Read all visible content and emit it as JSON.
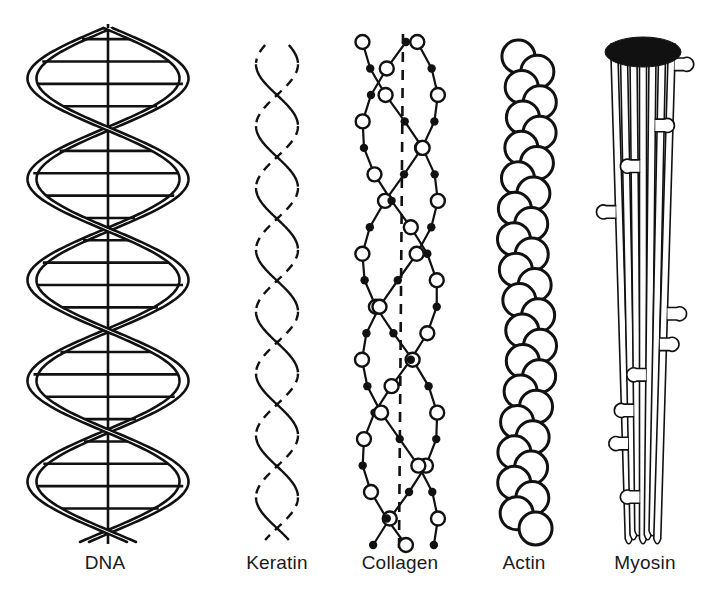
{
  "figure": {
    "background_color": "#ffffff",
    "ink_color": "#111111",
    "width": 705,
    "height": 596,
    "caption_baseline_y": 566,
    "caption_font_size": 19
  },
  "panels": [
    {
      "id": "dna",
      "label": "DNA",
      "label_center_x": 105,
      "structure_type": "double-helix-ribbon",
      "axis_x": 108,
      "top_y": 28,
      "bottom_y": 542,
      "amplitude": 76,
      "turns": 2.55,
      "ribbon_width": 9,
      "stroke_width": 2.6,
      "rung_count": 22,
      "rung_stroke_width": 2.6,
      "has_center_axis": true,
      "strand_count": 2,
      "description": "Right-handed double helix: two ribbon strands with horizontal base-pair rungs crossing a straight vertical axis"
    },
    {
      "id": "keratin",
      "label": "Keratin",
      "label_center_x": 277,
      "structure_type": "coiled-coil",
      "axis_x": 277,
      "top_y": 45,
      "bottom_y": 540,
      "amplitude": 21,
      "turns": 4.0,
      "stroke_width": 2.4,
      "dash_pattern": "9 7",
      "strand_count": 2,
      "has_center_axis": false,
      "description": "Two alpha-helical strands wound around each other; rear-facing segments drawn dashed"
    },
    {
      "id": "collagen",
      "label": "Collagen",
      "label_center_x": 400,
      "structure_type": "triple-helix-beaded",
      "axis_x": 400,
      "top_y": 42,
      "bottom_y": 545,
      "amplitude": 38,
      "turns": 1.55,
      "stroke_width": 2.2,
      "strand_count": 3,
      "bead_open_radius": 7.0,
      "bead_filled_radius": 4.2,
      "beads_per_strand": 19,
      "has_center_axis": true,
      "center_axis_dashed": true,
      "center_axis_dash_pattern": "10 8",
      "description": "Three polypeptide chains of alternating large open and small filled residues twisted about a dashed central axis"
    },
    {
      "id": "actin",
      "label": "Actin",
      "label_center_x": 524,
      "structure_type": "globular-double-strand",
      "axis_x": 527,
      "top_y": 40,
      "bottom_y": 545,
      "amplitude": 10,
      "turns": 2.0,
      "stroke_width": 3.0,
      "subunit_radius": 16.5,
      "subunit_count": 32,
      "strand_count": 2,
      "has_center_axis": false,
      "description": "Two strands of globular G-actin monomers forming a twisted filament of open circles"
    },
    {
      "id": "myosin",
      "label": "Myosin",
      "label_center_x": 645,
      "structure_type": "rod-bundle-with-heads",
      "axis_x": 643,
      "top_y": 36,
      "bottom_y": 545,
      "stroke_width": 1.6,
      "rod_count": 7,
      "rod_width": 7,
      "cap_fill": "#111111",
      "cap_center_x": 643,
      "cap_center_y": 52,
      "cap_radius_x": 38,
      "cap_radius_y": 15,
      "head_count": 10,
      "head_radius": 7,
      "description": "Bundle of parallel coiled-coil tails capped by a solid bare zone, with club-shaped heads projecting laterally"
    }
  ]
}
